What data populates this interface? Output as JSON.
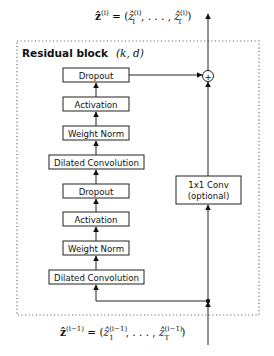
{
  "diagram": {
    "title": "Residual block",
    "title_params": "(k, d)",
    "output_label": {
      "lhs": "ẑ",
      "lhs_sup": "(i)",
      "eq": " = (",
      "first": "ẑ",
      "first_sub": "1",
      "first_sup": "(i)",
      "dots": ", . . . , ",
      "last": "ẑ",
      "last_sub": "T",
      "last_sup": "(i)",
      "close": ")"
    },
    "input_label": {
      "lhs": "ẑ",
      "lhs_sup": "(i−1)",
      "eq": " = (",
      "first": "ẑ",
      "first_sub": "1",
      "first_sup": "(i−1)",
      "dots": ", . . . , ",
      "last": "ẑ",
      "last_sub": "T",
      "last_sup": "(i−1)",
      "close": ")"
    },
    "main_path": [
      {
        "label": "Dropout"
      },
      {
        "label": "Activation"
      },
      {
        "label": "Weight Norm"
      },
      {
        "label": "Dilated Convolution"
      },
      {
        "label": "Dropout"
      },
      {
        "label": "Activation"
      },
      {
        "label": "Weight Norm"
      },
      {
        "label": "Dilated Convolution"
      }
    ],
    "skip_path": {
      "line1": "1x1 Conv",
      "line2": "(optional)"
    },
    "sum_symbol": "+"
  }
}
